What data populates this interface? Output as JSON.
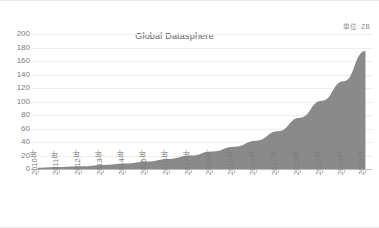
{
  "chart_data": {
    "type": "area",
    "title": "Global Datasphere",
    "unit_annotation": "单位: ZB",
    "xlabel": "",
    "ylabel": "",
    "ylim": [
      0,
      200
    ],
    "ytick_step": 20,
    "grid": true,
    "legend": "none",
    "series_color": "#8a8a8a",
    "categories": [
      "2010年",
      "2011年",
      "2012年",
      "2013年",
      "2014年",
      "2015年",
      "2016年",
      "2017年",
      "2018年",
      "2019年",
      "2020年",
      "2021年",
      "2022年",
      "2023年",
      "2024年",
      "2025年"
    ],
    "values": [
      2,
      3,
      4,
      6,
      8,
      11,
      15,
      20,
      26,
      33,
      42,
      56,
      76,
      101,
      130,
      175
    ],
    "ytick_labels": [
      "200",
      "180",
      "160",
      "140",
      "120",
      "100",
      "80",
      "60",
      "40",
      "20",
      "0"
    ],
    "ytick_values": [
      200,
      180,
      160,
      140,
      120,
      100,
      80,
      60,
      40,
      20,
      0
    ],
    "series": [
      {
        "name": "Global Datasphere",
        "values": [
          2,
          3,
          4,
          6,
          8,
          11,
          15,
          20,
          26,
          33,
          42,
          56,
          76,
          101,
          130,
          175
        ]
      }
    ]
  }
}
